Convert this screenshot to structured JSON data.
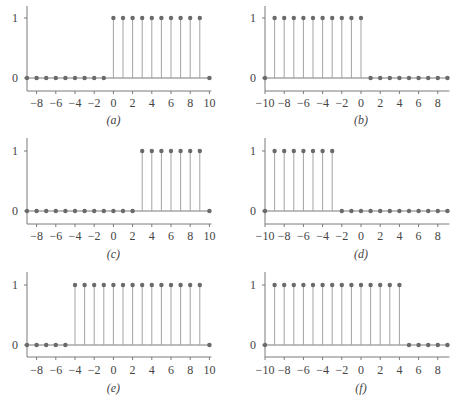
{
  "colors": {
    "axis": "#7a7a7a",
    "stem": "#a3a3a3",
    "marker": "#6a6a6a",
    "text": "#444444"
  },
  "chart_data": [
    {
      "type": "stem",
      "caption": "(a)",
      "x": [
        -9,
        -8,
        -7,
        -6,
        -5,
        -4,
        -3,
        -2,
        -1,
        0,
        1,
        2,
        3,
        4,
        5,
        6,
        7,
        8,
        9,
        10
      ],
      "values": [
        0,
        0,
        0,
        0,
        0,
        0,
        0,
        0,
        0,
        1,
        1,
        1,
        1,
        1,
        1,
        1,
        1,
        1,
        1,
        0
      ],
      "xlim": [
        -9,
        10
      ],
      "ylim": [
        -0.2,
        1.2
      ],
      "xticks": [
        -8,
        -6,
        -4,
        -2,
        0,
        2,
        4,
        6,
        8,
        10
      ],
      "xtick_labels": [
        "−8",
        "−6",
        "−4",
        "−2",
        "0",
        "2",
        "4",
        "6",
        "8",
        "10"
      ],
      "yticks": [
        0,
        1
      ],
      "ytick_labels": [
        "0",
        "1"
      ],
      "xlabel": "",
      "ylabel": "",
      "grid": false
    },
    {
      "type": "stem",
      "caption": "(b)",
      "x": [
        -10,
        -9,
        -8,
        -7,
        -6,
        -5,
        -4,
        -3,
        -2,
        -1,
        0,
        1,
        2,
        3,
        4,
        5,
        6,
        7,
        8,
        9
      ],
      "values": [
        0,
        1,
        1,
        1,
        1,
        1,
        1,
        1,
        1,
        1,
        1,
        0,
        0,
        0,
        0,
        0,
        0,
        0,
        0,
        0
      ],
      "xlim": [
        -10,
        9
      ],
      "ylim": [
        -0.2,
        1.2
      ],
      "xticks": [
        -10,
        -8,
        -6,
        -4,
        -2,
        0,
        2,
        4,
        6,
        8
      ],
      "xtick_labels": [
        "−10",
        "−8",
        "−6",
        "−4",
        "−2",
        "0",
        "2",
        "4",
        "6",
        "8"
      ],
      "yticks": [
        0,
        1
      ],
      "ytick_labels": [
        "0",
        "1"
      ],
      "xlabel": "",
      "ylabel": "",
      "grid": false
    },
    {
      "type": "stem",
      "caption": "(c)",
      "x": [
        -9,
        -8,
        -7,
        -6,
        -5,
        -4,
        -3,
        -2,
        -1,
        0,
        1,
        2,
        3,
        4,
        5,
        6,
        7,
        8,
        9,
        10
      ],
      "values": [
        0,
        0,
        0,
        0,
        0,
        0,
        0,
        0,
        0,
        0,
        0,
        0,
        1,
        1,
        1,
        1,
        1,
        1,
        1,
        0
      ],
      "xlim": [
        -9,
        10
      ],
      "ylim": [
        -0.2,
        1.2
      ],
      "xticks": [
        -8,
        -6,
        -4,
        -2,
        0,
        2,
        4,
        6,
        8,
        10
      ],
      "xtick_labels": [
        "−8",
        "−6",
        "−4",
        "−2",
        "0",
        "2",
        "4",
        "6",
        "8",
        "10"
      ],
      "yticks": [
        0,
        1
      ],
      "ytick_labels": [
        "0",
        "1"
      ],
      "xlabel": "",
      "ylabel": "",
      "grid": false
    },
    {
      "type": "stem",
      "caption": "(d)",
      "x": [
        -10,
        -9,
        -8,
        -7,
        -6,
        -5,
        -4,
        -3,
        -2,
        -1,
        0,
        1,
        2,
        3,
        4,
        5,
        6,
        7,
        8,
        9
      ],
      "values": [
        0,
        1,
        1,
        1,
        1,
        1,
        1,
        1,
        0,
        0,
        0,
        0,
        0,
        0,
        0,
        0,
        0,
        0,
        0,
        0
      ],
      "xlim": [
        -10,
        9
      ],
      "ylim": [
        -0.2,
        1.2
      ],
      "xticks": [
        -10,
        -8,
        -6,
        -4,
        -2,
        0,
        2,
        4,
        6,
        8
      ],
      "xtick_labels": [
        "−10",
        "−8",
        "−6",
        "−4",
        "−2",
        "0",
        "2",
        "4",
        "6",
        "8"
      ],
      "yticks": [
        0,
        1
      ],
      "ytick_labels": [
        "0",
        "1"
      ],
      "xlabel": "",
      "ylabel": "",
      "grid": false
    },
    {
      "type": "stem",
      "caption": "(e)",
      "x": [
        -9,
        -8,
        -7,
        -6,
        -5,
        -4,
        -3,
        -2,
        -1,
        0,
        1,
        2,
        3,
        4,
        5,
        6,
        7,
        8,
        9,
        10
      ],
      "values": [
        0,
        0,
        0,
        0,
        0,
        1,
        1,
        1,
        1,
        1,
        1,
        1,
        1,
        1,
        1,
        1,
        1,
        1,
        1,
        0
      ],
      "xlim": [
        -9,
        10
      ],
      "ylim": [
        -0.2,
        1.2
      ],
      "xticks": [
        -8,
        -6,
        -4,
        -2,
        0,
        2,
        4,
        6,
        8,
        10
      ],
      "xtick_labels": [
        "−8",
        "−6",
        "−4",
        "−2",
        "0",
        "2",
        "4",
        "6",
        "8",
        "10"
      ],
      "yticks": [
        0,
        1
      ],
      "ytick_labels": [
        "0",
        "1"
      ],
      "xlabel": "",
      "ylabel": "",
      "grid": false
    },
    {
      "type": "stem",
      "caption": "(f)",
      "x": [
        -10,
        -9,
        -8,
        -7,
        -6,
        -5,
        -4,
        -3,
        -2,
        -1,
        0,
        1,
        2,
        3,
        4,
        5,
        6,
        7,
        8,
        9
      ],
      "values": [
        0,
        1,
        1,
        1,
        1,
        1,
        1,
        1,
        1,
        1,
        1,
        1,
        1,
        1,
        1,
        0,
        0,
        0,
        0,
        0
      ],
      "xlim": [
        -10,
        9
      ],
      "ylim": [
        -0.2,
        1.2
      ],
      "xticks": [
        -10,
        -8,
        -6,
        -4,
        -2,
        0,
        2,
        4,
        6,
        8
      ],
      "xtick_labels": [
        "−10",
        "−8",
        "−6",
        "−4",
        "−2",
        "0",
        "2",
        "4",
        "6",
        "8"
      ],
      "yticks": [
        0,
        1
      ],
      "ytick_labels": [
        "0",
        "1"
      ],
      "xlabel": "",
      "ylabel": "",
      "grid": false
    }
  ],
  "layout": {
    "panels": [
      {
        "x0": 27,
        "y_top": 6,
        "y1": 18,
        "y0": 78,
        "y_bottom": 91,
        "tick_label_y": 107,
        "caption_y": 124
      },
      {
        "x0": 265,
        "y_top": 6,
        "y1": 18,
        "y0": 78,
        "y_bottom": 91,
        "tick_label_y": 107,
        "caption_y": 124
      },
      {
        "x0": 27,
        "y_top": 138,
        "y1": 151,
        "y0": 211,
        "y_bottom": 224,
        "tick_label_y": 240,
        "caption_y": 258
      },
      {
        "x0": 265,
        "y_top": 138,
        "y1": 151,
        "y0": 211,
        "y_bottom": 224,
        "tick_label_y": 240,
        "caption_y": 258
      },
      {
        "x0": 27,
        "y_top": 272,
        "y1": 285,
        "y0": 345,
        "y_bottom": 357,
        "tick_label_y": 374,
        "caption_y": 392
      },
      {
        "x0": 265,
        "y_top": 272,
        "y1": 285,
        "y0": 345,
        "y_bottom": 357,
        "tick_label_y": 374,
        "caption_y": 392
      }
    ],
    "unit_px": 9.6
  }
}
